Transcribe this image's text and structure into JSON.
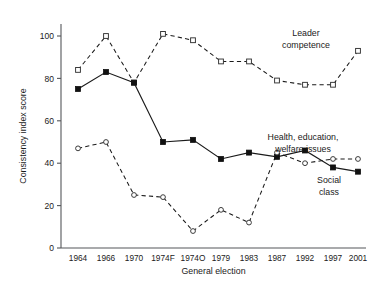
{
  "chart_data": {
    "type": "line",
    "title": "",
    "xlabel": "General election",
    "ylabel": "Consistency index score",
    "categories": [
      "1964",
      "1966",
      "1970",
      "1974F",
      "1974O",
      "1979",
      "1983",
      "1987",
      "1992",
      "1997",
      "2001"
    ],
    "ylim": [
      0,
      108
    ],
    "yticks": [
      0,
      20,
      40,
      60,
      80,
      100
    ],
    "ytick_labels": [
      "0",
      "20",
      "40",
      "60",
      "80",
      "100"
    ],
    "grid": false,
    "legend_position": "inline-annotations",
    "series": [
      {
        "name": "Leader competence",
        "marker": "open-square",
        "line_style": "dashed",
        "values": [
          84,
          100,
          78,
          101,
          98,
          88,
          88,
          79,
          77,
          77,
          93
        ]
      },
      {
        "name": "Health, education, welfare issues",
        "marker": "filled-square",
        "line_style": "solid",
        "values": [
          75,
          83,
          78,
          50,
          51,
          42,
          45,
          43,
          46,
          38,
          36
        ]
      },
      {
        "name": "Social class",
        "marker": "open-circle",
        "line_style": "dashed",
        "values": [
          47,
          50,
          25,
          24,
          8,
          18,
          12,
          45,
          40,
          42,
          42
        ]
      }
    ],
    "annotations": [
      {
        "text": "Leader competence",
        "lines": [
          "Leader",
          "competence"
        ],
        "x": 306,
        "y": 36
      },
      {
        "text": "Health, education, welfare issues",
        "lines": [
          "Health, education,",
          "welfare issues"
        ],
        "x": 303,
        "y": 140
      },
      {
        "text": "Social class",
        "lines": [
          "Social",
          "class"
        ],
        "x": 329,
        "y": 183
      }
    ]
  }
}
